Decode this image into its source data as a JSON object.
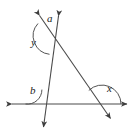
{
  "figure": {
    "background_color": "#ffffff",
    "stroke_color": "#4a4a4a",
    "label_color": "#1a1a1a",
    "stroke_width": 1.1,
    "width": 138,
    "height": 139
  },
  "labels": {
    "a": "a",
    "y": "y",
    "b": "b",
    "x": "x"
  },
  "label_positions": {
    "a": {
      "x": 47,
      "y": 13
    },
    "y": {
      "x": 31,
      "y": 37
    },
    "b": {
      "x": 30,
      "y": 85
    },
    "x": {
      "x": 107,
      "y": 83
    }
  },
  "lines": [
    {
      "name": "horizontal-base-line",
      "x1": 9,
      "y1": 104,
      "x2": 130,
      "y2": 104,
      "arrow_start": true,
      "arrow_end": true
    },
    {
      "name": "steep-line",
      "x1": 59,
      "y1": 13,
      "x2": 43,
      "y2": 130,
      "arrow_start": true,
      "arrow_end": true
    },
    {
      "name": "transversal-line",
      "x1": 37,
      "y1": 13,
      "x2": 113,
      "y2": 122,
      "arrow_start": true,
      "arrow_end": true
    }
  ],
  "intersections": {
    "top_crossing": {
      "x": 52,
      "y": 36
    },
    "steep_on_base": {
      "x": 40,
      "y": 104
    },
    "transversal_on_base": {
      "x": 102,
      "y": 104
    }
  },
  "angle_arcs": [
    {
      "name": "angle-arc-y",
      "vertex": {
        "x": 52,
        "y": 36
      },
      "radius": 17,
      "description": "large arc at top crossing, opening to the left"
    },
    {
      "name": "angle-arc-b",
      "vertex": {
        "x": 40,
        "y": 104
      },
      "radius": 15,
      "description": "arc above the base line on the left side of the steep line"
    },
    {
      "name": "angle-arc-x",
      "vertex": {
        "x": 102,
        "y": 104
      },
      "radius": 20,
      "description": "arc above the base line between the transversal and the rightward ray"
    }
  ]
}
